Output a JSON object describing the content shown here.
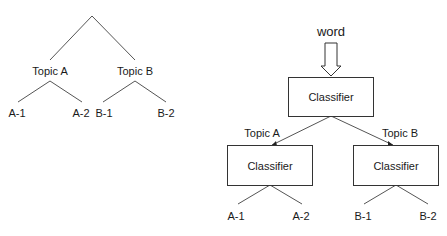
{
  "left_tree": {
    "level1": [
      "Topic A",
      "Topic B"
    ],
    "leaves": [
      "A-1",
      "A-2",
      "B-1",
      "B-2"
    ]
  },
  "right_diagram": {
    "input_label": "word",
    "root_box": "Classifier",
    "branch_labels": [
      "Topic A",
      "Topic B"
    ],
    "child_boxes": [
      "Classifier",
      "Classifier"
    ],
    "leaves": [
      "A-1",
      "A-2",
      "B-1",
      "B-2"
    ]
  },
  "colors": {
    "line": "#555555",
    "text": "#1a1a1a",
    "box_border": "#333333"
  }
}
